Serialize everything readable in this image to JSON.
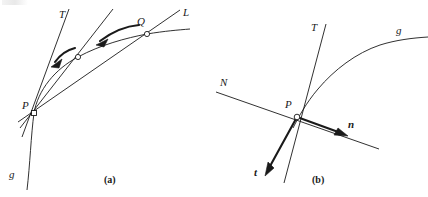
{
  "figure": {
    "background_color": "#ffffff",
    "stroke_color": "#1a1a1a",
    "width": 428,
    "height": 197,
    "panels": [
      {
        "id": "a",
        "caption": "(a)",
        "caption_pos": {
          "x": 104,
          "y": 181
        },
        "description": "Secant lines PQ approaching the tangent line T at point P on curve g",
        "points": [
          {
            "name": "P",
            "label": "P",
            "marker": "open-square",
            "x": 34,
            "y": 113,
            "label_x": 23,
            "label_y": 106
          },
          {
            "name": "Q",
            "label": "Q",
            "marker": "open-circle",
            "x": 147,
            "y": 34,
            "label_x": 137,
            "label_y": 22
          },
          {
            "name": "M",
            "label": "",
            "marker": "open-circle",
            "x": 78,
            "y": 57,
            "label_x": 0,
            "label_y": 0
          }
        ],
        "lines": [
          {
            "name": "T",
            "label": "T",
            "label_x": 59,
            "label_y": 15,
            "role": "tangent-line"
          },
          {
            "name": "S1",
            "label": "",
            "label_x": 0,
            "label_y": 0,
            "role": "secant-line-mid"
          },
          {
            "name": "L",
            "label": "L",
            "label_x": 183,
            "label_y": 13,
            "role": "secant-line-PQ"
          }
        ],
        "curve": {
          "name": "g",
          "label": "g",
          "label_x": 9,
          "label_y": 176
        },
        "arrows": [
          {
            "name": "arrow-Q-to-mid",
            "role": "secant-approaching-tangent"
          },
          {
            "name": "arrow-mid-to-tangent",
            "role": "secant-approaching-tangent"
          }
        ]
      },
      {
        "id": "b",
        "caption": "(b)",
        "caption_pos": {
          "x": 313,
          "y": 181
        },
        "description": "Tangent line T, normal line N, unit tangent vector t and unit normal vector n at point P on curve g",
        "points": [
          {
            "name": "P",
            "label": "P",
            "marker": "open-circle",
            "x": 297,
            "y": 117,
            "label_x": 285,
            "label_y": 105
          }
        ],
        "lines": [
          {
            "name": "T",
            "label": "T",
            "label_x": 311,
            "label_y": 28,
            "role": "tangent-line"
          },
          {
            "name": "N",
            "label": "N",
            "label_x": 221,
            "label_y": 83,
            "role": "normal-line"
          }
        ],
        "vectors": [
          {
            "name": "t",
            "label": "t",
            "label_x": 255,
            "label_y": 172,
            "role": "unit-tangent-vector"
          },
          {
            "name": "n",
            "label": "n",
            "label_x": 348,
            "label_y": 124,
            "role": "unit-normal-vector"
          }
        ],
        "curve": {
          "name": "g",
          "label": "g",
          "label_x": 396,
          "label_y": 31
        }
      }
    ]
  }
}
